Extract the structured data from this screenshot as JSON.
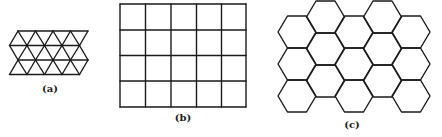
{
  "figure": {
    "panels": [
      {
        "id": "a",
        "label": "(a)",
        "type": "triangular-lattice",
        "label_pos": [
          50,
          88
        ],
        "side": 17.5,
        "row_y": [
          31,
          45.5,
          60,
          74.5
        ],
        "row_x0": [
          18,
          9.5,
          18,
          9.5
        ],
        "points_per_row": 5
      },
      {
        "id": "b",
        "label": "(b)",
        "type": "square-lattice",
        "label_pos": [
          183,
          117
        ],
        "x": [
          120,
          145.5,
          171,
          196.5,
          221.5,
          246
        ],
        "y": [
          4,
          30,
          55.5,
          81,
          107
        ]
      },
      {
        "id": "c",
        "label": "(c)",
        "type": "hexagonal-lattice",
        "label_pos": [
          352,
          124
        ],
        "side": 19,
        "half_height": 16,
        "columns": [
          {
            "cx": 297,
            "cy": [
              32,
              64,
              96
            ]
          },
          {
            "cx": 325.5,
            "cy": [
              17,
              49,
              81
            ]
          },
          {
            "cx": 354,
            "cy": [
              32,
              64,
              96
            ]
          },
          {
            "cx": 382.5,
            "cy": [
              17,
              49,
              81
            ]
          },
          {
            "cx": 411,
            "cy": [
              32,
              64,
              96
            ]
          }
        ]
      }
    ],
    "stroke_color": "#1a1a1a",
    "background": "#ffffff"
  }
}
